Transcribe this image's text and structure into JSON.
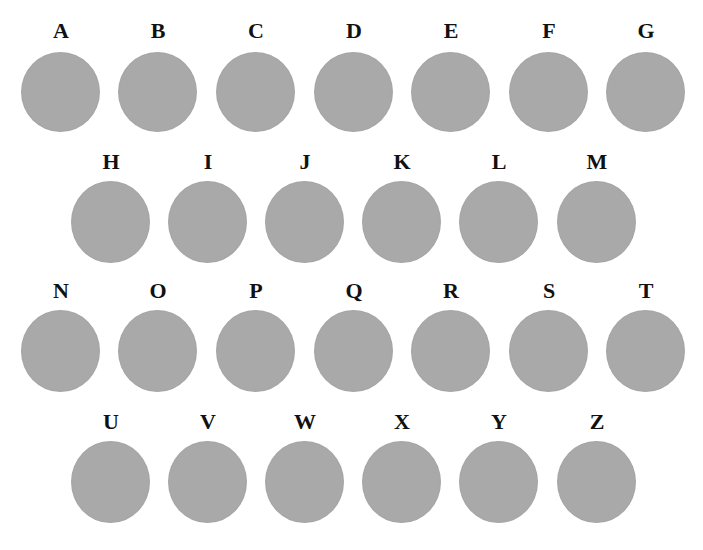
{
  "colors": {
    "disc": "#a9a9a9",
    "label": "#111111",
    "background": "#ffffff"
  },
  "rows": [
    {
      "letters": [
        "A",
        "B",
        "C",
        "D",
        "E",
        "F",
        "G"
      ]
    },
    {
      "letters": [
        "H",
        "I",
        "J",
        "K",
        "L",
        "M"
      ]
    },
    {
      "letters": [
        "N",
        "O",
        "P",
        "Q",
        "R",
        "S",
        "T"
      ]
    },
    {
      "letters": [
        "U",
        "V",
        "W",
        "X",
        "Y",
        "Z"
      ]
    }
  ]
}
